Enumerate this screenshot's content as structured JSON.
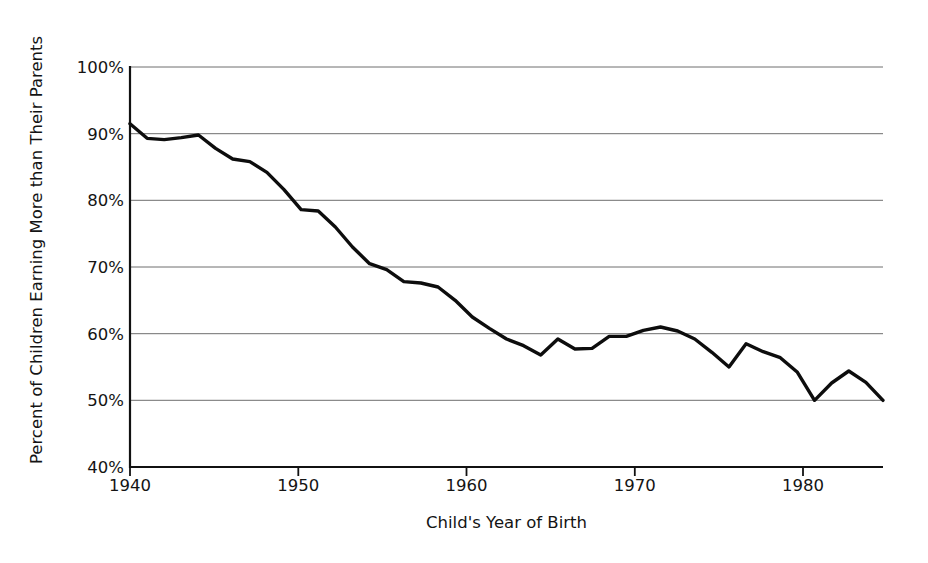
{
  "chart_data": {
    "type": "line",
    "title": "",
    "subtitle": "",
    "xlabel": "Child's Year of Birth",
    "ylabel": "Percent of Children Earning More than Their Parents",
    "xlim": [
      1940,
      1984
    ],
    "ylim": [
      40,
      100
    ],
    "grid": true,
    "legend": null,
    "ytick_labels": [
      "100%",
      "90%",
      "80%",
      "70%",
      "60%",
      "50%",
      "40%"
    ],
    "ytick_values": [
      100,
      90,
      80,
      70,
      60,
      50,
      40
    ],
    "xtick_labels": [
      "1940",
      "1950",
      "1960",
      "1970",
      "1980"
    ],
    "xtick_values": [
      1940,
      1950,
      1960,
      1970,
      1980
    ],
    "series": [
      {
        "name": "Absolute mobility",
        "x": [
          1940,
          1941,
          1942,
          1943,
          1944,
          1945,
          1946,
          1947,
          1948,
          1949,
          1950,
          1951,
          1952,
          1953,
          1954,
          1955,
          1956,
          1957,
          1958,
          1959,
          1960,
          1961,
          1962,
          1963,
          1964,
          1965,
          1966,
          1967,
          1968,
          1969,
          1970,
          1971,
          1972,
          1973,
          1974,
          1975,
          1976,
          1977,
          1978,
          1979,
          1980,
          1981,
          1982,
          1983,
          1984
        ],
        "values": [
          91.5,
          89.3,
          89.1,
          89.4,
          89.8,
          87.8,
          86.2,
          85.8,
          84.2,
          81.6,
          78.6,
          78.4,
          76.0,
          73.0,
          70.5,
          69.6,
          67.8,
          67.6,
          67.0,
          65.0,
          62.5,
          60.8,
          59.2,
          58.2,
          56.8,
          59.2,
          57.7,
          57.8,
          59.6,
          59.6,
          60.5,
          61.0,
          60.4,
          59.2,
          57.2,
          55.0,
          58.5,
          57.3,
          56.4,
          54.2,
          50.0,
          52.6,
          54.4,
          52.7,
          50.0
        ]
      }
    ]
  },
  "axes": {
    "ylabel_text": "Percent of Children Earning More than Their Parents",
    "xlabel_text": "Child's Year of Birth"
  }
}
